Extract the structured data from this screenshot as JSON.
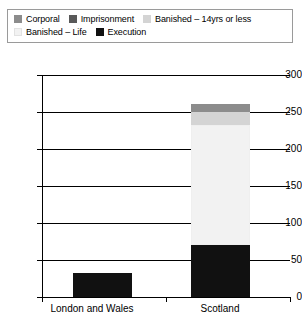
{
  "chart_data": {
    "type": "bar",
    "subtype": "stacked-bar",
    "title": "",
    "xlabel": "",
    "ylabel": "",
    "categories": [
      "London and Wales",
      "Scotland"
    ],
    "ylim": [
      0,
      300
    ],
    "yticks": [
      0,
      50,
      100,
      150,
      200,
      250,
      300
    ],
    "ytick_labels": [
      "0",
      "50",
      "100",
      "150",
      "200",
      "250",
      "300"
    ],
    "grid": true,
    "legend_position": "top",
    "series": [
      {
        "name": "Corporal",
        "color": "#8c8c8c",
        "values": [
          0,
          11
        ]
      },
      {
        "name": "Imprisonment",
        "color": "#595959",
        "values": [
          0,
          0
        ]
      },
      {
        "name": "Banished – 14yrs or less",
        "color": "#d4d4d4",
        "values": [
          0,
          18
        ]
      },
      {
        "name": "Banished – Life",
        "color": "#f2f2f2",
        "values": [
          0,
          162
        ]
      },
      {
        "name": "Execution",
        "color": "#111111",
        "values": [
          33,
          70
        ]
      }
    ],
    "stack_order_bottom_to_top": [
      "Execution",
      "Banished – Life",
      "Banished – 14yrs or less",
      "Imprisonment",
      "Corporal"
    ],
    "totals": [
      33,
      261
    ]
  },
  "legend": {
    "rows": [
      [
        {
          "label": "Corporal",
          "color": "#8c8c8c"
        },
        {
          "label": "Imprisonment",
          "color": "#595959"
        },
        {
          "label": "Banished – 14yrs or less",
          "color": "#d4d4d4"
        }
      ],
      [
        {
          "label": "Banished – Life",
          "color": "#f2f2f2"
        },
        {
          "label": "Execution",
          "color": "#111111"
        }
      ]
    ]
  }
}
